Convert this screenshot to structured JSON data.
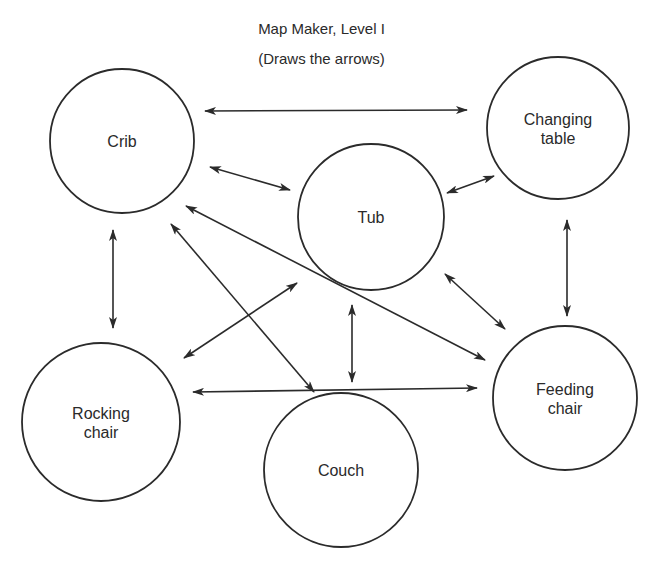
{
  "title": "Map Maker, Level I",
  "subtitle": "(Draws the arrows)",
  "nodes": [
    {
      "id": "crib",
      "label_lines": [
        "Crib"
      ],
      "cx": 122,
      "cy": 141,
      "r": 72
    },
    {
      "id": "changing-table",
      "label_lines": [
        "Changing",
        "table"
      ],
      "cx": 558,
      "cy": 128,
      "r": 71
    },
    {
      "id": "tub",
      "label_lines": [
        "Tub"
      ],
      "cx": 371,
      "cy": 217,
      "r": 73
    },
    {
      "id": "rocking-chair",
      "label_lines": [
        "Rocking",
        "chair"
      ],
      "cx": 101,
      "cy": 422,
      "r": 79
    },
    {
      "id": "couch",
      "label_lines": [
        "Couch"
      ],
      "cx": 341,
      "cy": 470,
      "r": 77
    },
    {
      "id": "feeding-chair",
      "label_lines": [
        "Feeding",
        "chair"
      ],
      "cx": 565,
      "cy": 398,
      "r": 72
    }
  ],
  "edges": [
    {
      "from": "crib",
      "to": "changing-table",
      "bidirectional": true,
      "x1": 205,
      "y1": 111,
      "x2": 467,
      "y2": 110
    },
    {
      "from": "crib",
      "to": "tub",
      "bidirectional": true,
      "x1": 210,
      "y1": 167,
      "x2": 290,
      "y2": 190
    },
    {
      "from": "tub",
      "to": "changing-table",
      "bidirectional": true,
      "x1": 447,
      "y1": 193,
      "x2": 494,
      "y2": 176
    },
    {
      "from": "crib",
      "to": "rocking-chair",
      "bidirectional": true,
      "x1": 113,
      "y1": 230,
      "x2": 113,
      "y2": 328
    },
    {
      "from": "changing-table",
      "to": "feeding-chair",
      "bidirectional": true,
      "x1": 567,
      "y1": 220,
      "x2": 567,
      "y2": 316
    },
    {
      "from": "crib",
      "to": "feeding-chair",
      "bidirectional": true,
      "x1": 186,
      "y1": 206,
      "x2": 485,
      "y2": 360
    },
    {
      "from": "crib",
      "to": "couch",
      "bidirectional": true,
      "x1": 171,
      "y1": 224,
      "x2": 314,
      "y2": 392
    },
    {
      "from": "rocking-chair",
      "to": "tub",
      "bidirectional": true,
      "x1": 184,
      "y1": 358,
      "x2": 297,
      "y2": 283
    },
    {
      "from": "tub",
      "to": "couch",
      "bidirectional": true,
      "x1": 352,
      "y1": 305,
      "x2": 352,
      "y2": 382
    },
    {
      "from": "tub",
      "to": "feeding-chair",
      "bidirectional": true,
      "x1": 445,
      "y1": 274,
      "x2": 505,
      "y2": 329
    },
    {
      "from": "rocking-chair",
      "to": "feeding-chair",
      "bidirectional": true,
      "x1": 193,
      "y1": 392,
      "x2": 477,
      "y2": 388
    }
  ]
}
